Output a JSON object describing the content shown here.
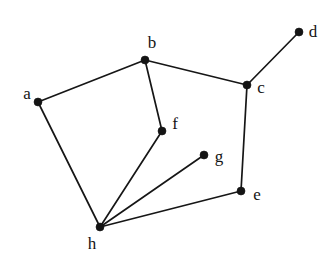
{
  "figure": {
    "width": 334,
    "height": 262,
    "background_color": "#ffffff",
    "ink_color": "#141414"
  },
  "chart_data": {
    "type": "diagram",
    "subtype": "node-link-graph",
    "title": "",
    "xlabel": "",
    "ylabel": "",
    "grid": false,
    "legend": null,
    "directed": false,
    "weighted": false,
    "node_count": 8,
    "edge_count": 9,
    "xlim": [
      0,
      334
    ],
    "ylim": [
      0,
      262
    ],
    "nodes": [
      {
        "id": "a",
        "label": "a",
        "x": 38,
        "y": 102,
        "label_x": 27,
        "label_y": 93,
        "degree": 2
      },
      {
        "id": "b",
        "label": "b",
        "x": 145,
        "y": 60,
        "label_x": 152,
        "label_y": 42,
        "degree": 3
      },
      {
        "id": "c",
        "label": "c",
        "x": 247,
        "y": 85,
        "label_x": 261,
        "label_y": 87,
        "degree": 3
      },
      {
        "id": "d",
        "label": "d",
        "x": 299,
        "y": 32,
        "label_x": 313,
        "label_y": 31,
        "degree": 1
      },
      {
        "id": "e",
        "label": "e",
        "x": 241,
        "y": 191,
        "label_x": 257,
        "label_y": 194,
        "degree": 2
      },
      {
        "id": "f",
        "label": "f",
        "x": 162,
        "y": 131,
        "label_x": 175,
        "label_y": 123,
        "degree": 2
      },
      {
        "id": "g",
        "label": "g",
        "x": 204,
        "y": 155,
        "label_x": 219,
        "label_y": 156,
        "degree": 1
      },
      {
        "id": "h",
        "label": "h",
        "x": 100,
        "y": 227,
        "label_x": 92,
        "label_y": 243,
        "degree": 4
      }
    ],
    "edges": [
      {
        "source": "a",
        "target": "b",
        "x1": 38,
        "y1": 102,
        "x2": 145,
        "y2": 60
      },
      {
        "source": "a",
        "target": "h",
        "x1": 38,
        "y1": 102,
        "x2": 100,
        "y2": 227
      },
      {
        "source": "b",
        "target": "c",
        "x1": 145,
        "y1": 60,
        "x2": 247,
        "y2": 85
      },
      {
        "source": "b",
        "target": "f",
        "x1": 145,
        "y1": 60,
        "x2": 162,
        "y2": 131
      },
      {
        "source": "c",
        "target": "d",
        "x1": 247,
        "y1": 85,
        "x2": 299,
        "y2": 32
      },
      {
        "source": "c",
        "target": "e",
        "x1": 247,
        "y1": 85,
        "x2": 241,
        "y2": 191
      },
      {
        "source": "e",
        "target": "h",
        "x1": 241,
        "y1": 191,
        "x2": 100,
        "y2": 227
      },
      {
        "source": "f",
        "target": "h",
        "x1": 162,
        "y1": 131,
        "x2": 100,
        "y2": 227
      },
      {
        "source": "g",
        "target": "h",
        "x1": 204,
        "y1": 155,
        "x2": 100,
        "y2": 227
      }
    ],
    "node_radius": 4.0,
    "edge_width": 1.7
  }
}
